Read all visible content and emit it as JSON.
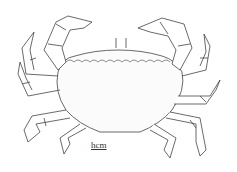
{
  "figure": {
    "scale_label": "hcm",
    "colors": {
      "ink": "#333333",
      "background": "#ffffff"
    }
  }
}
